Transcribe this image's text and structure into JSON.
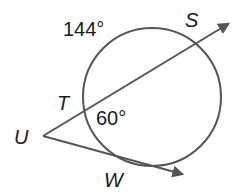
{
  "diagram": {
    "type": "circle-secant-tangent",
    "stroke_color": "#555555",
    "text_color": "#1a1a1a",
    "labels": {
      "point_S": "S",
      "point_T": "T",
      "point_U": "U",
      "point_W": "W",
      "arc_major": "144°",
      "arc_minor": "60°"
    }
  }
}
